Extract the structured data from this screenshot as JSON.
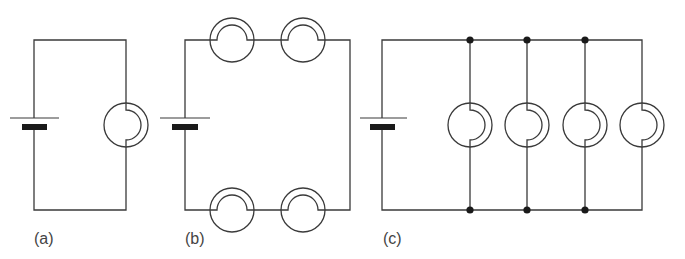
{
  "figure": {
    "panels": [
      {
        "id": "a",
        "label": "(a)",
        "description": "Single cell with one lamp",
        "bulb_count": 1,
        "arrangement": "single"
      },
      {
        "id": "b",
        "label": "(b)",
        "description": "Single cell with four lamps in series",
        "bulb_count": 4,
        "arrangement": "series"
      },
      {
        "id": "c",
        "label": "(c)",
        "description": "Single cell with four lamps in parallel",
        "bulb_count": 4,
        "arrangement": "parallel",
        "junction_count": 6
      }
    ],
    "colors": {
      "wire": "#3a3a3a",
      "battery_plate": "#1a1a1a",
      "junction": "#1a1a1a",
      "label": "#444444",
      "background": "#ffffff"
    }
  }
}
